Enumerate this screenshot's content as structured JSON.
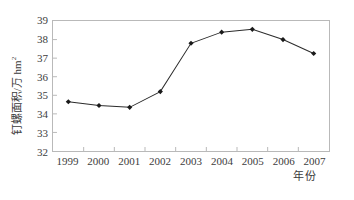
{
  "artifact": {
    "top_text": "· ·· ·· · ·"
  },
  "chart_data": {
    "type": "line",
    "title": "",
    "subtitle": "",
    "xlabel": "年份",
    "ylabel": "钉螺面积/万 hm²",
    "ylabel_main": "钉螺面积/万 hm",
    "ylabel_sup": "2",
    "categories": [
      "1999",
      "2000",
      "2001",
      "2002",
      "2003",
      "2004",
      "2005",
      "2006",
      "2007"
    ],
    "x": [
      1999,
      2000,
      2001,
      2002,
      2003,
      2004,
      2005,
      2006,
      2007
    ],
    "values": [
      34.65,
      34.45,
      34.35,
      35.2,
      37.8,
      38.4,
      38.55,
      38.0,
      37.25
    ],
    "series": [
      {
        "name": "钉螺面积",
        "values": [
          34.65,
          34.45,
          34.35,
          35.2,
          37.8,
          38.4,
          38.55,
          38.0,
          37.25
        ]
      }
    ],
    "ylim": [
      32,
      39
    ],
    "xlim": [
      1998.5,
      2007.5
    ],
    "yticks": [
      32,
      33,
      34,
      35,
      36,
      37,
      38,
      39
    ],
    "ytick_labels": [
      "32",
      "33",
      "34",
      "35",
      "36",
      "37",
      "38",
      "39"
    ],
    "grid": false,
    "legend": false,
    "legend_position": "none",
    "marker": "diamond",
    "line_color": "#2b2b2b",
    "marker_color": "#1a1a1a",
    "frame_color": "#b9b9b9",
    "background": "#ffffff"
  }
}
